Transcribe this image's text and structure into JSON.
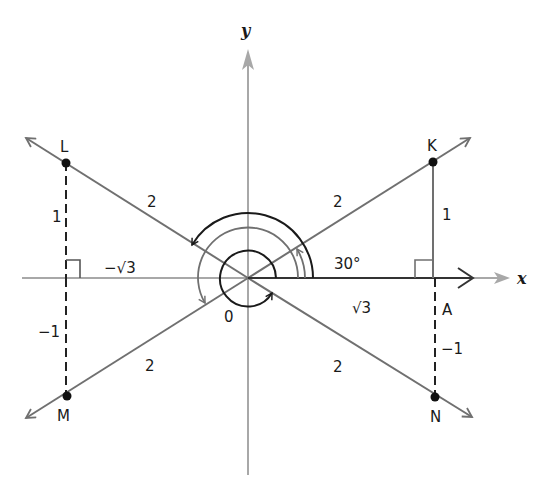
{
  "diagram": {
    "axes": {
      "x_label": "x",
      "y_label": "y"
    },
    "origin_label": "0",
    "points": {
      "K": {
        "label": "K",
        "quadrant": "I"
      },
      "L": {
        "label": "L",
        "quadrant": "II"
      },
      "M": {
        "label": "M",
        "quadrant": "III"
      },
      "N": {
        "label": "N",
        "quadrant": "IV"
      },
      "A": {
        "label": "A"
      }
    },
    "segment_labels": {
      "OK": "2",
      "OL": "2",
      "OM": "2",
      "ON": "2",
      "KA": "1",
      "L_foot": "1",
      "M_foot": "−1",
      "AN": "−1",
      "OA": "√3",
      "O_negx": "−√3"
    },
    "angle_label": "30°",
    "colors": {
      "axis": "#a8a8a8",
      "ray": "#707070",
      "arc_dark": "#1a1a1a",
      "arc_gray": "#707070",
      "point": "#111111",
      "text": "#1a1a1a"
    }
  }
}
